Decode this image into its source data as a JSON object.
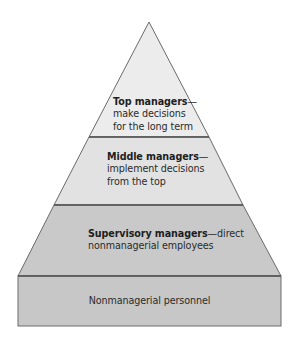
{
  "diagram": {
    "type": "pyramid",
    "colors": {
      "outline": "#6a6a6a",
      "top_fill": "#ececec",
      "middle_fill": "#e2e2e2",
      "supervisory_fill": "#c9c9c9",
      "base_fill": "#c7c7c7",
      "text": "#2b2b2b"
    },
    "levels": [
      {
        "id": "top",
        "title": "Top managers",
        "dash": "—",
        "lines": [
          "make decisions",
          "for the long term"
        ]
      },
      {
        "id": "middle",
        "title": "Middle managers",
        "dash": "—",
        "lines": [
          "implement decisions",
          "from the top"
        ]
      },
      {
        "id": "supervisory",
        "title": "Supervisory managers",
        "dash": "—direct",
        "lines": [
          "nonmanagerial employees"
        ]
      },
      {
        "id": "base",
        "title": "",
        "lines": [
          "Nonmanagerial personnel"
        ]
      }
    ]
  }
}
